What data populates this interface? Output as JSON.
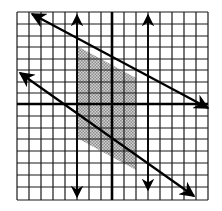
{
  "figure": {
    "type": "coordinate-grid-inequality-graph",
    "grid": {
      "cells_x": 16,
      "cells_y": 16,
      "x_range": [
        -8,
        8
      ],
      "y_range": [
        -8,
        8
      ]
    },
    "colors": {
      "grid": "#1a1a1a",
      "axis": "#000000",
      "shade": "#b8b8b8",
      "line": "#000000",
      "background": "#ffffff"
    },
    "lines": [
      {
        "name": "upper-diagonal-boundary",
        "direction": "both-arrows",
        "from": [
          -7,
          8
        ],
        "to": [
          8,
          0
        ]
      },
      {
        "name": "lower-diagonal-boundary",
        "direction": "both-arrows",
        "from": [
          -8,
          3
        ],
        "to": [
          7,
          -8
        ]
      },
      {
        "name": "left-vertical-boundary",
        "direction": "both-arrows",
        "x": -3
      },
      {
        "name": "right-vertical-boundary",
        "direction": "both-arrows",
        "x": 2
      }
    ],
    "shaded_region": "parallelogram bounded by x=-3, x=2 and the two diagonal lines"
  }
}
